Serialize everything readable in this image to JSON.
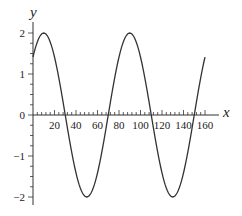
{
  "chart_data": {
    "type": "line",
    "title": "",
    "xlabel": "x",
    "ylabel": "y",
    "xlim": [
      0,
      160
    ],
    "ylim": [
      -2,
      2
    ],
    "grid": false,
    "legend": null,
    "x_ticks": [
      20,
      40,
      60,
      80,
      100,
      120,
      140,
      160
    ],
    "x_tick_labels": [
      "20",
      "40",
      "60",
      "80",
      "100",
      "120",
      "140",
      "160"
    ],
    "y_ticks": [
      -2,
      -1,
      0,
      1,
      2
    ],
    "y_tick_labels": [
      "−2",
      "−1",
      "0",
      "1",
      "2"
    ],
    "x_minor_step": 4,
    "y_minor_step": 0.25,
    "series": [
      {
        "name": "y = 2 sin(π(x+10)/40)",
        "x": [
          0,
          10,
          20,
          30,
          40,
          50,
          60,
          70,
          80,
          90,
          100,
          110,
          120,
          130,
          140,
          150,
          160
        ],
        "values": [
          1.41,
          2,
          1.41,
          0,
          -1.41,
          -2,
          -1.41,
          0,
          1.41,
          2,
          1.41,
          0,
          -1.41,
          -2,
          -1.41,
          0,
          1.41
        ]
      }
    ],
    "curve_color": "#333333"
  }
}
